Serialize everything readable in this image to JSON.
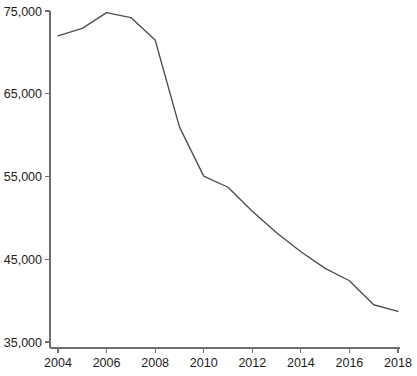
{
  "chart_data": {
    "type": "line",
    "title": "",
    "subtitle": "",
    "xlabel": "",
    "ylabel": "",
    "x": [
      2004,
      2005,
      2006,
      2007,
      2008,
      2009,
      2010,
      2011,
      2012,
      2013,
      2014,
      2015,
      2016,
      2017,
      2018
    ],
    "values": [
      72000,
      72900,
      74800,
      74200,
      71500,
      61000,
      55050,
      53700,
      50800,
      48200,
      45900,
      43900,
      42400,
      39500,
      38700
    ],
    "series": [
      {
        "name": "",
        "values": [
          72000,
          72900,
          74800,
          74200,
          71500,
          61000,
          55050,
          53700,
          50800,
          48200,
          45900,
          43900,
          42400,
          39500,
          38700
        ]
      }
    ],
    "xlim": [
      2004,
      2018
    ],
    "ylim": [
      35000,
      75000
    ],
    "grid": false,
    "legend": "none",
    "line_color": "#4d4d4d",
    "axis_color": "#6e6e6e",
    "x_tick_labels": [
      "2004",
      "2006",
      "2008",
      "2010",
      "2012",
      "2014",
      "2016",
      "2018"
    ],
    "x_tick_values": [
      2004,
      2006,
      2008,
      2010,
      2012,
      2014,
      2016,
      2018
    ],
    "y_tick_labels": [
      "75,000",
      "65,000",
      "55,000",
      "45,000",
      "35,000"
    ],
    "y_tick_values": [
      75000,
      65000,
      55000,
      45000,
      35000
    ]
  }
}
